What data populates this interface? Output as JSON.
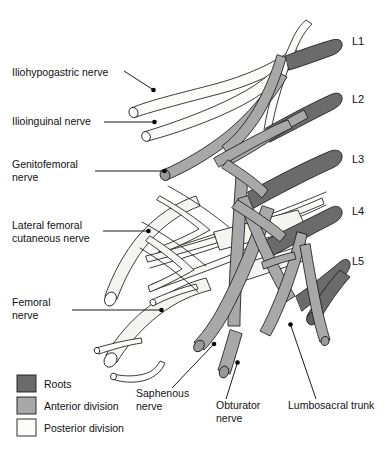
{
  "figure": {
    "background_color": "#ffffff",
    "outline_color": "#1a1a1a"
  },
  "colors": {
    "roots": "#6b6b6b",
    "anterior_division": "#a8a8a8",
    "posterior_division": "#f7f7f5",
    "outline": "#1a1a1a",
    "leader": "#000000",
    "text": "#111111"
  },
  "root_labels": [
    {
      "name": "L1",
      "x": 352,
      "y": 45
    },
    {
      "name": "L2",
      "x": 352,
      "y": 103
    },
    {
      "name": "L3",
      "x": 352,
      "y": 163
    },
    {
      "name": "L4",
      "x": 352,
      "y": 215
    },
    {
      "name": "L5",
      "x": 352,
      "y": 265
    }
  ],
  "nerve_labels": [
    {
      "id": "iliohypogastric",
      "lines": [
        "Iliohypogastric nerve"
      ],
      "x": 12,
      "y": 76
    },
    {
      "id": "ilioinguinal",
      "lines": [
        "Ilioinguinal nerve"
      ],
      "x": 12,
      "y": 125
    },
    {
      "id": "genitofemoral",
      "lines": [
        "Genitofemoral",
        "nerve"
      ],
      "x": 12,
      "y": 168
    },
    {
      "id": "lateral-femoral-cutaneous",
      "lines": [
        "Lateral femoral",
        "cutaneous nerve"
      ],
      "x": 12,
      "y": 229
    },
    {
      "id": "femoral",
      "lines": [
        "Femoral",
        "nerve"
      ],
      "x": 12,
      "y": 306
    },
    {
      "id": "saphenous",
      "lines": [
        "Saphenous",
        "nerve"
      ],
      "x": 136,
      "y": 397
    },
    {
      "id": "obturator",
      "lines": [
        "Obturator",
        "nerve"
      ],
      "x": 216,
      "y": 409
    },
    {
      "id": "lumbosacral-trunk",
      "lines": [
        "Lumbosacral trunk"
      ],
      "x": 288,
      "y": 409
    }
  ],
  "legend": {
    "items": [
      {
        "label": "Roots",
        "swatch": "#6b6b6b"
      },
      {
        "label": "Anterior division",
        "swatch": "#a8a8a8"
      },
      {
        "label": "Posterior division",
        "swatch": "#fbfbf9"
      }
    ]
  }
}
